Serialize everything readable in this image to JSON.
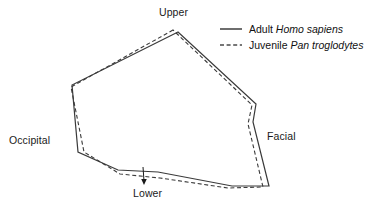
{
  "figure": {
    "type": "polygon-outline-diagram",
    "background_color": "#ffffff",
    "line_color": "#333333",
    "width": 380,
    "height": 212
  },
  "labels": {
    "upper": "Upper",
    "occipital": "Occipital",
    "facial": "Facial",
    "lower": "Lower"
  },
  "legend": {
    "items": [
      {
        "style": "solid",
        "label_plain": "Adult Homo sapiens",
        "label_prefix": "Adult ",
        "label_italic": "Homo sapiens",
        "color": "#4a4a4a"
      },
      {
        "style": "dashed",
        "label_plain": "Juvenile Pan troglodytes",
        "label_prefix": "Juvenile ",
        "label_italic": "Pan troglodytes",
        "color": "#4a4a4a"
      }
    ]
  },
  "chart_data": {
    "type": "line",
    "title": "",
    "xlabel": "",
    "ylabel": "",
    "grid": false,
    "legend_position": "top-right",
    "annotations": [
      {
        "text": "Upper",
        "anchor_x": 178,
        "anchor_y": 32,
        "label_x": 179,
        "label_y": 12
      },
      {
        "text": "Occipital",
        "anchor_x": 78,
        "anchor_y": 152,
        "label_x": 34,
        "label_y": 140
      },
      {
        "text": "Facial",
        "anchor_x": 253,
        "anchor_y": 122,
        "label_x": 284,
        "label_y": 136
      },
      {
        "text": "Lower",
        "anchor_x": 143,
        "anchor_y": 168,
        "label_x": 150,
        "label_y": 193,
        "leader": true
      }
    ],
    "series": [
      {
        "name": "Adult Homo sapiens",
        "style": "solid",
        "closed": true,
        "points": [
          [
            178,
            32
          ],
          [
            72,
            85
          ],
          [
            78,
            152
          ],
          [
            118,
            170
          ],
          [
            158,
            172
          ],
          [
            232,
            186
          ],
          [
            269,
            186
          ],
          [
            253,
            122
          ],
          [
            256,
            104
          ]
        ]
      },
      {
        "name": "Juvenile Pan troglodytes",
        "style": "dashed",
        "closed": true,
        "points": [
          [
            173,
            30
          ],
          [
            71,
            87
          ],
          [
            84,
            152
          ],
          [
            120,
            174
          ],
          [
            160,
            178
          ],
          [
            228,
            188
          ],
          [
            263,
            187
          ],
          [
            248,
            124
          ],
          [
            252,
            105
          ]
        ]
      }
    ]
  }
}
